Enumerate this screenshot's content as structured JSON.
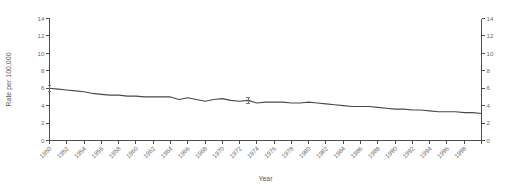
{
  "chart_data": {
    "type": "line",
    "title": "",
    "xlabel": "Year",
    "ylabel": "Rate per 100,000",
    "xlim": [
      1950,
      2000
    ],
    "ylim": [
      0,
      14
    ],
    "grid": false,
    "legend": null,
    "y_ticks": [
      0,
      2,
      4,
      6,
      8,
      10,
      12,
      14
    ],
    "y_tick_labels": [
      "0",
      "2",
      "4",
      "6",
      "8",
      "10",
      "12",
      "14"
    ],
    "right_axis": {
      "ylabel": "",
      "ylim": [
        0,
        14
      ],
      "y_ticks": [
        0,
        2,
        4,
        6,
        8,
        10,
        12,
        14
      ],
      "y_tick_labels": [
        "0",
        "2",
        "4",
        "6",
        "8",
        "10",
        "12",
        "14"
      ]
    },
    "x_tick_labels": [
      "1950",
      "1952",
      "1954",
      "1956",
      "1958",
      "1960",
      "1962",
      "1964",
      "1966",
      "1968",
      "1970",
      "1972",
      "1974",
      "1976",
      "1978",
      "1980",
      "1982",
      "1984",
      "1986",
      "1988",
      "1990",
      "1992",
      "1994",
      "1996",
      "1998"
    ],
    "x_ticks": [
      1950,
      1952,
      1954,
      1956,
      1958,
      1960,
      1962,
      1964,
      1966,
      1968,
      1970,
      1972,
      1974,
      1976,
      1978,
      1980,
      1982,
      1984,
      1986,
      1988,
      1990,
      1992,
      1994,
      1996,
      1998
    ],
    "x_minor_ticks": [
      2000
    ],
    "series": [
      {
        "name": "Rate",
        "x": [
          1950,
          1951,
          1952,
          1953,
          1954,
          1955,
          1956,
          1957,
          1958,
          1959,
          1960,
          1961,
          1962,
          1963,
          1964,
          1965,
          1966,
          1967,
          1968,
          1969,
          1970,
          1971,
          1972,
          1973,
          1974,
          1975,
          1976,
          1977,
          1978,
          1979,
          1980,
          1981,
          1982,
          1983,
          1984,
          1985,
          1986,
          1987,
          1988,
          1989,
          1990,
          1991,
          1992,
          1993,
          1994,
          1995,
          1996,
          1997,
          1998,
          1999,
          2000
        ],
        "y": [
          6.0,
          5.9,
          5.8,
          5.7,
          5.6,
          5.4,
          5.3,
          5.2,
          5.2,
          5.1,
          5.1,
          5.0,
          5.0,
          5.0,
          5.0,
          4.7,
          4.9,
          4.7,
          4.5,
          4.7,
          4.8,
          4.6,
          4.5,
          4.6,
          4.3,
          4.4,
          4.4,
          4.4,
          4.3,
          4.3,
          4.4,
          4.3,
          4.2,
          4.1,
          4.0,
          3.9,
          3.9,
          3.9,
          3.8,
          3.7,
          3.6,
          3.6,
          3.5,
          3.5,
          3.4,
          3.3,
          3.3,
          3.3,
          3.2,
          3.2,
          3.1
        ]
      }
    ],
    "errorbars": [
      {
        "x": 1950,
        "y": 6.0,
        "low": 5.6,
        "high": 6.3
      },
      {
        "x": 1973,
        "y": 4.6,
        "low": 4.3,
        "high": 4.9
      }
    ]
  }
}
